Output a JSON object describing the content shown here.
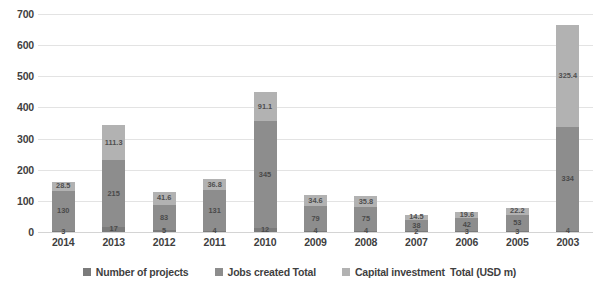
{
  "chart_data": {
    "type": "bar",
    "stacked": true,
    "title": "",
    "subtitle": "",
    "xlabel": "",
    "ylabel": "",
    "ylim": [
      0,
      700
    ],
    "ytick_step": 100,
    "yticks": [
      "700",
      "600",
      "500",
      "400",
      "300",
      "200",
      "100",
      "0"
    ],
    "grid": true,
    "legend_position": "bottom",
    "categories": [
      "2014",
      "2013",
      "2012",
      "2011",
      "2010",
      "2009",
      "2008",
      "2007",
      "2006",
      "2005",
      "2003"
    ],
    "series": [
      {
        "name": "Number of projects",
        "color": "#7b7b7b",
        "values": [
          3,
          17,
          5,
          4,
          12,
          4,
          4,
          2,
          3,
          3,
          4
        ]
      },
      {
        "name": "Jobs created Total",
        "color": "#8d8d8d",
        "values": [
          130,
          215,
          83,
          131,
          345,
          79,
          75,
          38,
          42,
          53,
          334
        ]
      },
      {
        "name": "Capital investment  Total (USD m)",
        "color": "#b2b2b2",
        "values": [
          28.5,
          111.3,
          41.6,
          36.8,
          91.1,
          34.6,
          35.8,
          14.5,
          19.6,
          22.2,
          325.4
        ]
      }
    ],
    "data_labels": {
      "2014": {
        "projects": "3",
        "jobs": "130",
        "capital": "28.5"
      },
      "2013": {
        "projects": "17",
        "jobs": "215",
        "capital": "111.3"
      },
      "2012": {
        "projects": "5",
        "jobs": "83",
        "capital": "41.6"
      },
      "2011": {
        "projects": "4",
        "jobs": "131",
        "capital": "36.8"
      },
      "2010": {
        "projects": "12",
        "jobs": "345",
        "capital": "91.1"
      },
      "2009": {
        "projects": "4",
        "jobs": "79",
        "capital": "34.6"
      },
      "2008": {
        "projects": "4",
        "jobs": "75",
        "capital": "35.8"
      },
      "2007": {
        "projects": "2",
        "jobs": "38",
        "capital": "14.5"
      },
      "2006": {
        "projects": "3",
        "jobs": "42",
        "capital": "19.6"
      },
      "2005": {
        "projects": "3",
        "jobs": "53",
        "capital": "22.2"
      },
      "2003": {
        "projects": "4",
        "jobs": "334",
        "capital": "325.4"
      }
    }
  },
  "legend": {
    "items": [
      {
        "label": "Number of projects",
        "swatch": "sw-projects"
      },
      {
        "label": "Jobs created Total",
        "swatch": "sw-jobs"
      },
      {
        "label": "Capital investment  Total (USD m)",
        "swatch": "sw-capital"
      }
    ]
  }
}
